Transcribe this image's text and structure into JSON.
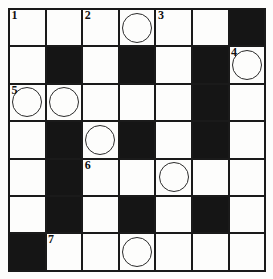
{
  "puzzle": {
    "kind": "crossword-grid",
    "rows": 7,
    "cols": 7,
    "colors": {
      "block": "#151515",
      "open": "#fdfdfc",
      "grid_line": "#1a1a1a",
      "number": "#111111",
      "circle": "#2b2b2b",
      "page_background": "#ffffff"
    },
    "numbers_visible": [
      "1",
      "2",
      "3",
      "4",
      "5",
      "6",
      "7"
    ],
    "circle_count": 8,
    "block_count": 16,
    "cells": [
      [
        {
          "type": "open",
          "number": "1",
          "circle": false,
          "letter": ""
        },
        {
          "type": "open",
          "number": "",
          "circle": false,
          "letter": ""
        },
        {
          "type": "open",
          "number": "2",
          "circle": false,
          "letter": ""
        },
        {
          "type": "open",
          "number": "",
          "circle": true,
          "letter": ""
        },
        {
          "type": "open",
          "number": "3",
          "circle": false,
          "letter": ""
        },
        {
          "type": "open",
          "number": "",
          "circle": false,
          "letter": ""
        },
        {
          "type": "block",
          "number": "",
          "circle": false,
          "letter": ""
        }
      ],
      [
        {
          "type": "open",
          "number": "",
          "circle": false,
          "letter": ""
        },
        {
          "type": "block",
          "number": "",
          "circle": false,
          "letter": ""
        },
        {
          "type": "open",
          "number": "",
          "circle": false,
          "letter": ""
        },
        {
          "type": "block",
          "number": "",
          "circle": false,
          "letter": ""
        },
        {
          "type": "open",
          "number": "",
          "circle": false,
          "letter": ""
        },
        {
          "type": "block",
          "number": "",
          "circle": false,
          "letter": ""
        },
        {
          "type": "open",
          "number": "4",
          "circle": true,
          "letter": ""
        }
      ],
      [
        {
          "type": "open",
          "number": "5",
          "circle": true,
          "letter": ""
        },
        {
          "type": "open",
          "number": "",
          "circle": true,
          "letter": ""
        },
        {
          "type": "open",
          "number": "",
          "circle": false,
          "letter": ""
        },
        {
          "type": "open",
          "number": "",
          "circle": false,
          "letter": ""
        },
        {
          "type": "open",
          "number": "",
          "circle": false,
          "letter": ""
        },
        {
          "type": "block",
          "number": "",
          "circle": false,
          "letter": ""
        },
        {
          "type": "open",
          "number": "",
          "circle": false,
          "letter": ""
        }
      ],
      [
        {
          "type": "open",
          "number": "",
          "circle": false,
          "letter": ""
        },
        {
          "type": "block",
          "number": "",
          "circle": false,
          "letter": ""
        },
        {
          "type": "open",
          "number": "",
          "circle": true,
          "letter": ""
        },
        {
          "type": "block",
          "number": "",
          "circle": false,
          "letter": ""
        },
        {
          "type": "open",
          "number": "",
          "circle": false,
          "letter": ""
        },
        {
          "type": "block",
          "number": "",
          "circle": false,
          "letter": ""
        },
        {
          "type": "open",
          "number": "",
          "circle": false,
          "letter": ""
        }
      ],
      [
        {
          "type": "open",
          "number": "",
          "circle": false,
          "letter": ""
        },
        {
          "type": "block",
          "number": "",
          "circle": false,
          "letter": ""
        },
        {
          "type": "open",
          "number": "6",
          "circle": false,
          "letter": ""
        },
        {
          "type": "open",
          "number": "",
          "circle": false,
          "letter": ""
        },
        {
          "type": "open",
          "number": "",
          "circle": true,
          "letter": ""
        },
        {
          "type": "open",
          "number": "",
          "circle": false,
          "letter": ""
        },
        {
          "type": "open",
          "number": "",
          "circle": false,
          "letter": ""
        }
      ],
      [
        {
          "type": "open",
          "number": "",
          "circle": false,
          "letter": ""
        },
        {
          "type": "block",
          "number": "",
          "circle": false,
          "letter": ""
        },
        {
          "type": "open",
          "number": "",
          "circle": false,
          "letter": ""
        },
        {
          "type": "block",
          "number": "",
          "circle": false,
          "letter": ""
        },
        {
          "type": "open",
          "number": "",
          "circle": false,
          "letter": ""
        },
        {
          "type": "block",
          "number": "",
          "circle": false,
          "letter": ""
        },
        {
          "type": "open",
          "number": "",
          "circle": false,
          "letter": ""
        }
      ],
      [
        {
          "type": "block",
          "number": "",
          "circle": false,
          "letter": ""
        },
        {
          "type": "open",
          "number": "7",
          "circle": false,
          "letter": ""
        },
        {
          "type": "open",
          "number": "",
          "circle": false,
          "letter": ""
        },
        {
          "type": "open",
          "number": "",
          "circle": true,
          "letter": ""
        },
        {
          "type": "open",
          "number": "",
          "circle": false,
          "letter": ""
        },
        {
          "type": "open",
          "number": "",
          "circle": false,
          "letter": ""
        },
        {
          "type": "open",
          "number": "",
          "circle": false,
          "letter": ""
        }
      ]
    ]
  }
}
